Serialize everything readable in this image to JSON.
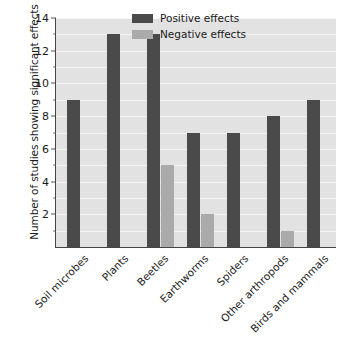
{
  "chart_data": {
    "type": "bar",
    "title": "",
    "subtitle": "",
    "xlabel": "",
    "ylabel": "Number of studies showing significant effects",
    "categories": [
      "Soil microbes",
      "Plants",
      "Beetles",
      "Earthworms",
      "Spiders",
      "Other arthropods",
      "Birds and mammals"
    ],
    "series": [
      {
        "name": "Positive effects",
        "color": "#4a4a4a",
        "values": [
          9,
          13,
          13,
          7,
          7,
          8,
          9
        ]
      },
      {
        "name": "Negative effects",
        "color": "#aaaaaa",
        "values": [
          0,
          0,
          5,
          2,
          0,
          1,
          0
        ]
      }
    ],
    "ylim": [
      0,
      14
    ],
    "y_major_ticks": [
      2,
      4,
      6,
      8,
      10,
      12,
      14
    ],
    "y_minor_ticks": [
      1,
      3,
      5,
      7,
      9,
      11,
      13
    ],
    "y_tick_labels": [
      "2",
      "4",
      "6",
      "8",
      "10",
      "12",
      "14"
    ],
    "grid": true,
    "grid_color": "#f4f4f4",
    "plot_background": "#e2e2e2",
    "legend_position": "top-center"
  },
  "legend": {
    "entries": [
      {
        "label": "Positive effects",
        "color": "#4a4a4a"
      },
      {
        "label": "Negative effects",
        "color": "#aaaaaa"
      }
    ]
  }
}
